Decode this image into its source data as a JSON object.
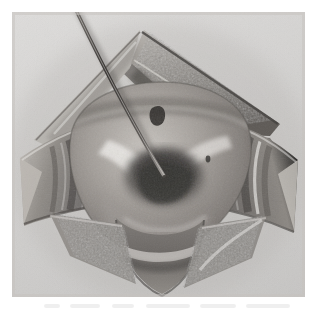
{
  "figure": {
    "kind": "anatomical-surgical-illustration",
    "medium": "halftone-pencil-wash",
    "title": "",
    "caption": "",
    "figure_number": "",
    "alt_description": "Grayscale surgical illustration: a diamond-shaped (rhomboid) operative wound held open by retracted tissue flaps at top, left, right and bottom, exposing a rounded deep structure with a dark central cleft; a thin straight probe enters from the upper left and its tip rests in the cleft.",
    "orientation": "upright",
    "colors": {
      "paper": "#ffffff",
      "plate_background": "#d9d9d9",
      "tissue_mid": "#9a9a9a",
      "tissue_dark": "#5d5d5d",
      "tissue_darkest": "#3a3a3a",
      "tissue_light": "#c9c9c9",
      "highlight": "#efefef",
      "instrument": "#4a4a4a"
    },
    "plate_bounds": {
      "left": 12,
      "top": 12,
      "width": 293,
      "height": 285
    }
  },
  "labels": {
    "none_visible": "No printed labels, leader lines, letters or numbers appear within the plate."
  },
  "parts": [
    {
      "id": "wound-margin-upper-right",
      "name": "Upper right retracted tissue flap",
      "note": "Triangular flap folded back, coarsely stippled fatty/areolar surface"
    },
    {
      "id": "wound-margin-upper-left",
      "name": "Upper left wound margin",
      "note": "Smoothly shaded skin edge forming the upper-left side of the diamond"
    },
    {
      "id": "wound-margin-left",
      "name": "Left retracted flap",
      "note": "Banded, striated fascial surface with transverse shading"
    },
    {
      "id": "wound-margin-right",
      "name": "Right retracted flap",
      "note": "Banded fascial surface with bright highlight band near its free edge"
    },
    {
      "id": "wound-margin-lower",
      "name": "Lower apex of the incision",
      "note": "Converging margins forming the inferior point of the diamond"
    },
    {
      "id": "exposed-structure",
      "name": "Exposed rounded deep structure",
      "note": "Dome-like mass occupying the centre of the field"
    },
    {
      "id": "central-cleft",
      "name": "Dark central cleft / defect",
      "note": "Deepest shadow, where the probe tip is introduced"
    },
    {
      "id": "probe",
      "name": "Probe / fine instrument",
      "note": "Thin straight shaft entering from the upper left, tip in the central cleft"
    }
  ]
}
